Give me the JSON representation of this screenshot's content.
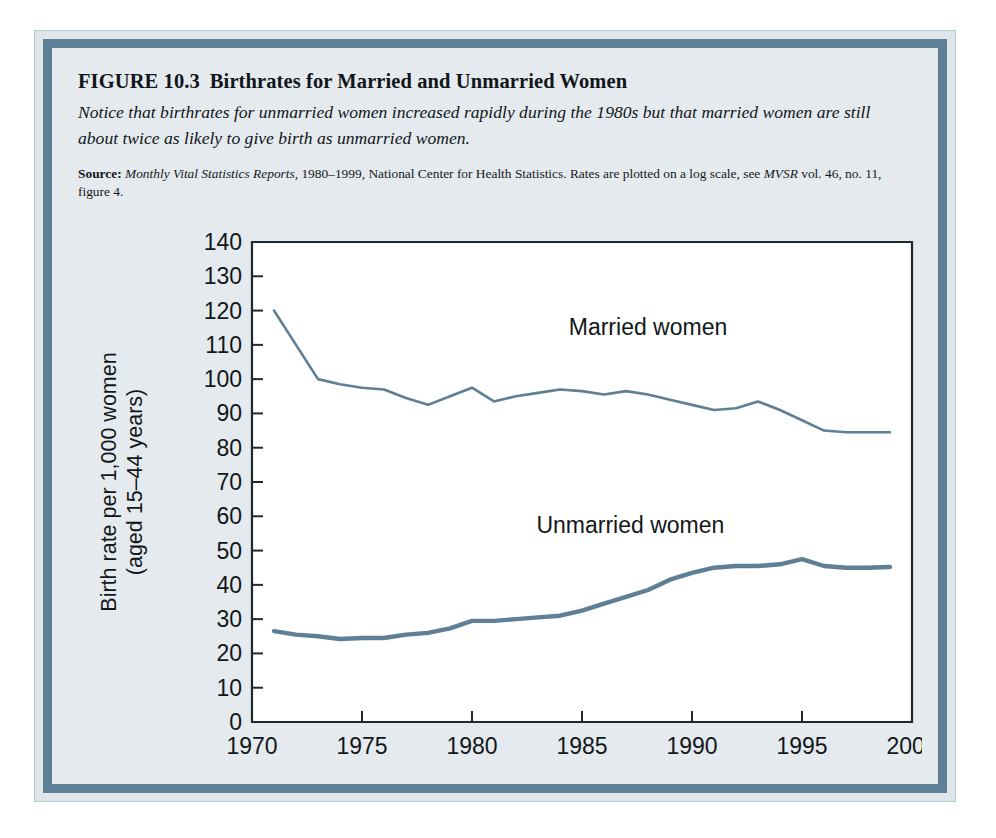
{
  "figure": {
    "number": "FIGURE 10.3",
    "title": "Birthrates for Married and Unmarried Women",
    "caption": "Notice that birthrates for unmarried women increased rapidly during the 1980s but that married women are still about twice as likely to give birth as unmarried women.",
    "source_label": "Source:",
    "source_italic_1": "Monthly Vital Statistics Reports,",
    "source_text_1": " 1980–1999, National Center for Health Statistics. Rates are plotted on a log scale, see ",
    "source_italic_2": "MVSR",
    "source_text_2": " vol. 46, no. 11, figure 4."
  },
  "colors": {
    "line": "#5e7f96",
    "frame": "#5f7f97",
    "panel_bg": "#e4eaed",
    "plot_bg": "#ffffff",
    "axis": "#20282e"
  },
  "chart_data": {
    "type": "line",
    "title": "Birthrates for Married and Unmarried Women",
    "xlabel": "",
    "ylabel": "Birth rate per 1,000 women (aged 15–44 years)",
    "ylabel_line1": "Birth rate per 1,000 women",
    "ylabel_line2": "(aged 15–44 years)",
    "xlim": [
      1970,
      2000
    ],
    "ylim": [
      0,
      140
    ],
    "yticks": [
      0,
      10,
      20,
      30,
      40,
      50,
      60,
      70,
      80,
      90,
      100,
      110,
      120,
      130,
      140
    ],
    "ytick_labels": [
      "0",
      "10",
      "20",
      "30",
      "40",
      "50",
      "60",
      "70",
      "80",
      "90",
      "100",
      "110",
      "120",
      "130",
      "140"
    ],
    "xticks": [
      1970,
      1975,
      1980,
      1985,
      1990,
      1995,
      2000
    ],
    "xtick_labels": [
      "1970",
      "1975",
      "1980",
      "1985",
      "1990",
      "1995",
      "2000"
    ],
    "grid": false,
    "legend_position": "inline-annotation",
    "annotations": [
      {
        "text": "Married women",
        "x": 1988.0,
        "y": 113
      },
      {
        "text": "Unmarried women",
        "x": 1987.2,
        "y": 55
      }
    ],
    "series": [
      {
        "name": "Married women",
        "label": "Married women",
        "color": "#5e7f96",
        "stroke_width": 2.6,
        "x": [
          1971,
          1972,
          1973,
          1974,
          1975,
          1976,
          1977,
          1978,
          1979,
          1980,
          1981,
          1982,
          1983,
          1984,
          1985,
          1986,
          1987,
          1988,
          1989,
          1990,
          1991,
          1992,
          1993,
          1994,
          1995,
          1996,
          1997,
          1998,
          1999
        ],
        "values": [
          120,
          110,
          100,
          98.5,
          97.5,
          97,
          94.5,
          92.5,
          95,
          97.5,
          93.5,
          95,
          96,
          97,
          96.5,
          95.5,
          96.5,
          95.5,
          94,
          92.5,
          91,
          91.5,
          93.5,
          91,
          88,
          85,
          84.5,
          84.5,
          84.5
        ]
      },
      {
        "name": "Unmarried women",
        "label": "Unmarried women",
        "color": "#5e7f96",
        "stroke_width": 4.4,
        "x": [
          1971,
          1972,
          1973,
          1974,
          1975,
          1976,
          1977,
          1978,
          1979,
          1980,
          1981,
          1982,
          1983,
          1984,
          1985,
          1986,
          1987,
          1988,
          1989,
          1990,
          1991,
          1992,
          1993,
          1994,
          1995,
          1996,
          1997,
          1998,
          1999
        ],
        "values": [
          26.5,
          25.5,
          25,
          24.2,
          24.5,
          24.5,
          25.5,
          26,
          27.3,
          29.5,
          29.5,
          30,
          30.5,
          31,
          32.5,
          34.5,
          36.5,
          38.5,
          41.5,
          43.5,
          45,
          45.5,
          45.5,
          46,
          47.5,
          45.5,
          45,
          45,
          45.2
        ]
      }
    ]
  }
}
